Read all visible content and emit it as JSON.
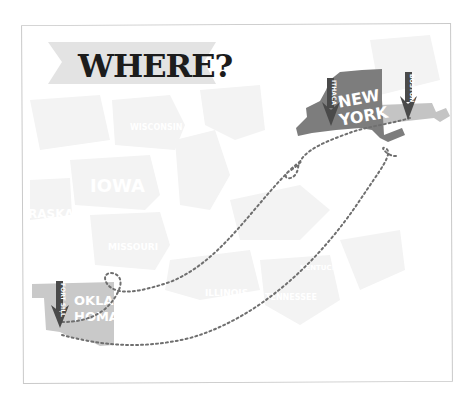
{
  "title": "WHERE?",
  "colors": {
    "frame_border": "#c9c9c9",
    "banner": "#e3e3e3",
    "title_text": "#1c1c1c",
    "ghost_states": "#f3f3f3",
    "new_york": "#7d7d7d",
    "massachusetts": "#c4c4c4",
    "oklahoma": "#c9c9c9",
    "pin": "#4a4a4a",
    "path_dots": "#6f6f6f"
  },
  "states": {
    "new_york": {
      "line1": "NEW",
      "line2": "YORK"
    },
    "oklahoma": {
      "line1": "OKLA",
      "line2": "HOMA"
    }
  },
  "background_labels": {
    "iowa": "IOWA",
    "nebraska": "RASKA",
    "missouri": "MISSOURI",
    "illinois": "ILLINOIS",
    "wisconsin": "WISCONSIN",
    "tennessee": "TENNESSEE",
    "kentucky": "KENTUCKY"
  },
  "pins": [
    {
      "id": "ithaca",
      "label": "ITHACA"
    },
    {
      "id": "boston",
      "label": "BOSTON"
    },
    {
      "id": "fort-sill",
      "label": "FORT SILL"
    }
  ]
}
